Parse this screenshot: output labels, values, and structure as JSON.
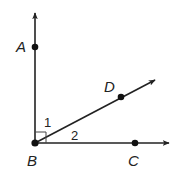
{
  "diagram": {
    "type": "geometry-angle-figure",
    "stroke_color": "#222222",
    "points": [
      {
        "name": "A",
        "label": "A",
        "x": 35,
        "y": 47,
        "label_x": 18,
        "label_y": 52
      },
      {
        "name": "B",
        "label": "B",
        "x": 35,
        "y": 143,
        "label_x": 27,
        "label_y": 166
      },
      {
        "name": "C",
        "label": "C",
        "x": 135,
        "y": 143,
        "label_x": 128,
        "label_y": 166
      },
      {
        "name": "D",
        "label": "D",
        "x": 121,
        "y": 97,
        "label_x": 104,
        "label_y": 92
      }
    ],
    "rays": [
      {
        "name": "ray-BA",
        "from": "B",
        "through": "A",
        "tip": [
          35,
          12
        ]
      },
      {
        "name": "ray-BD",
        "from": "B",
        "through": "D",
        "tip": [
          156,
          79
        ]
      },
      {
        "name": "ray-BC",
        "from": "B",
        "through": "C",
        "tip": [
          170,
          143
        ]
      }
    ],
    "angle_labels": [
      {
        "name": "angle-1",
        "label": "1",
        "x": 45,
        "y": 127
      },
      {
        "name": "angle-2",
        "label": "2",
        "x": 71,
        "y": 140
      }
    ],
    "right_angle_marker": {
      "at": "B",
      "size": 11
    }
  }
}
